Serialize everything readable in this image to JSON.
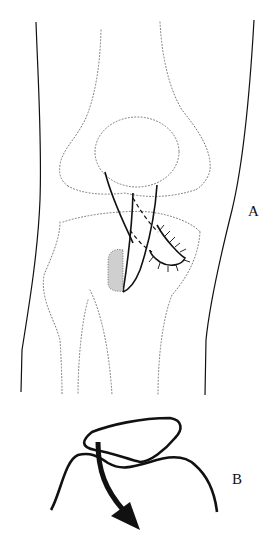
{
  "figure": {
    "panels": [
      {
        "id": "A",
        "label": "A",
        "description": "Anterior view of knee with graft through tunnel, sutured flap and stippled bone block"
      },
      {
        "id": "B",
        "label": "B",
        "description": "Schematic loop of graft with curved arrow indicating direction of pull"
      }
    ],
    "colors": {
      "line": "#111111",
      "dotted": "#777777",
      "background": "#ffffff"
    }
  }
}
